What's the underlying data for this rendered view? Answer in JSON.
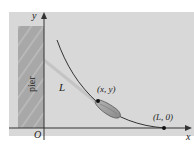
{
  "figure": {
    "background_color": "#d6d6d6",
    "pier_color": "#a9a9a9",
    "curve_color": "#333333",
    "axis_color": "#333333"
  },
  "labels": {
    "y_axis": "y",
    "x_axis": "x",
    "origin": "O",
    "pier": "pier",
    "rope_length": "L",
    "boat_point": "(x, y)",
    "end_point": "(L, 0)"
  },
  "icons": {
    "boat": "boat-icon",
    "point_marker": "dot-marker"
  }
}
